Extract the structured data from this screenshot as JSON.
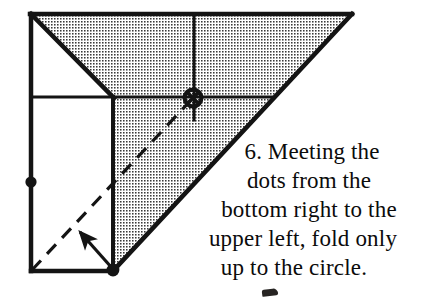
{
  "figure": {
    "step_number": "6.",
    "colors": {
      "ink": "#141414",
      "shaded_fill": "#b9b9b9",
      "paper": "#ffffff",
      "background": "#ffffff"
    },
    "shape": {
      "outline_points": "31,14 352,14 113,271 31,271",
      "top_left_corner": "31,14",
      "top_right_corner": "352,14",
      "bottom_right_corner": "113,271",
      "bottom_left_corner": "31,271"
    },
    "shaded_region_points": "113,14 352,14 113,271",
    "shaded_upper_band_points": "31,14 113,97 113,14",
    "crease_lines": [
      {
        "name": "horizontal-crease",
        "from": "31,97",
        "to": "272,97"
      },
      {
        "name": "vertical-crease",
        "from": "194,14",
        "to": "194,120"
      },
      {
        "name": "left-vertical-crease",
        "from": "113,97",
        "to": "113,271"
      },
      {
        "name": "upper-left-diagonal-crease",
        "from": "31,14",
        "to": "113,97"
      }
    ],
    "fold_line": {
      "name": "dashed-fold-line",
      "from": "32,270",
      "to": "193,98",
      "style": "dashed"
    },
    "markers": [
      {
        "name": "dot-left-edge",
        "type": "dot",
        "cx": 31,
        "cy": 182,
        "r": 5.4
      },
      {
        "name": "dot-bottom-right",
        "type": "dot",
        "cx": 113,
        "cy": 270,
        "r": 6.2
      },
      {
        "name": "circle-target",
        "type": "circle-with-cross",
        "cx": 193,
        "cy": 98,
        "r": 9.5
      }
    ],
    "arrow": {
      "name": "fold-direction-arrow",
      "from": "112,268",
      "to": "74,226"
    }
  },
  "caption": {
    "lines": [
      "6. Meeting the",
      "dots from the",
      "bottom right to the",
      "upper left, fold only",
      "up to the circle."
    ],
    "full_text": "6. Meeting the dots from the bottom right to the upper left, fold only up to the circle."
  }
}
